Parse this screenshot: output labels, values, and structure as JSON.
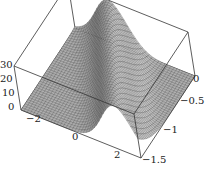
{
  "chart_data": {
    "type": "surface",
    "title": "",
    "xlabel": "",
    "ylabel": "",
    "zlabel": "",
    "x_ticks": [
      -2,
      0,
      2
    ],
    "x_tick_labels": [
      "−2",
      "0",
      "2"
    ],
    "y_ticks": [
      0,
      -0.5,
      -1,
      -1.5
    ],
    "y_tick_labels": [
      "0",
      "−0.5",
      "−1",
      "−1.5"
    ],
    "z_ticks": [
      0,
      10,
      20,
      30
    ],
    "z_tick_labels": [
      "0",
      "10",
      "20",
      "30"
    ],
    "xlim": [
      -3,
      3
    ],
    "ylim": [
      -1.5,
      0
    ],
    "zlim": [
      0,
      30
    ],
    "surface": "ridge: z ≈ 30·exp(-((x + 2·y + 1)^2)/1.2), wireframe mesh, gray shading",
    "grid_resolution": 40,
    "box": true,
    "colors": {
      "mesh_line": "#3a3a3a",
      "face_light": "#b0b0b0",
      "face_dark": "#555555",
      "box": "#333333"
    }
  },
  "labels": {
    "z": [
      {
        "text": "30",
        "x": 0,
        "y": 60
      },
      {
        "text": "20",
        "x": 0,
        "y": 74
      },
      {
        "text": "10",
        "x": 2,
        "y": 88
      },
      {
        "text": "0",
        "x": 8,
        "y": 102
      }
    ],
    "x": [
      {
        "text": "−2",
        "x": 26,
        "y": 114
      },
      {
        "text": "0",
        "x": 72,
        "y": 132
      },
      {
        "text": "2",
        "x": 114,
        "y": 150
      }
    ],
    "y": [
      {
        "text": "0",
        "x": 193,
        "y": 74
      },
      {
        "text": "−0.5",
        "x": 180,
        "y": 96
      },
      {
        "text": "−1",
        "x": 163,
        "y": 125
      },
      {
        "text": "−1.5",
        "x": 142,
        "y": 155
      }
    ]
  }
}
